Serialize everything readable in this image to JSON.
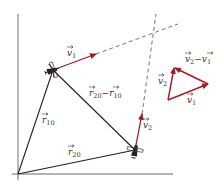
{
  "diagram": {
    "colors": {
      "axis": "#777777",
      "line": "#222222",
      "velocity": "#a01c2a",
      "dashed": "#666666"
    },
    "points": {
      "origin": [
        18,
        174
      ],
      "plane1": [
        53,
        70
      ],
      "plane2": [
        135,
        150
      ],
      "v1_tip": [
        96,
        54
      ],
      "v2_tip": [
        142,
        114
      ],
      "v1_extension_end": [
        178,
        24
      ],
      "v2_extension_end": [
        156,
        14
      ],
      "tri_base": [
        168,
        100
      ],
      "tri_v1_tip": [
        208,
        84
      ],
      "tri_v2_tip": [
        174,
        68
      ]
    },
    "labels": {
      "v1_near_plane": {
        "base": "v",
        "sub": "1"
      },
      "r10": {
        "base": "r",
        "sub": "10"
      },
      "r20": {
        "base": "r",
        "sub": "20"
      },
      "r20_minus_r10": {
        "a": "r",
        "a_sub": "20",
        "op": "−",
        "b": "r",
        "b_sub": "10"
      },
      "v2_near_plane": {
        "base": "v",
        "sub": "2"
      },
      "tri_v1": {
        "base": "v",
        "sub": "1"
      },
      "tri_v2": {
        "base": "v",
        "sub": "2"
      },
      "tri_v2_minus_v1": {
        "a": "v",
        "a_sub": "2",
        "op": "−",
        "b": "v",
        "b_sub": "1"
      }
    }
  }
}
